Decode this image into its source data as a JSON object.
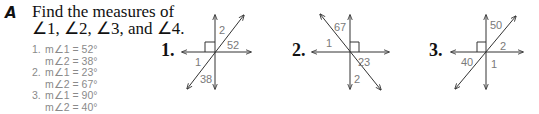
{
  "exercise": {
    "letter": "A",
    "prompt_line1": "Find the measures of",
    "prompt_line2": "∠1, ∠2, ∠3, and ∠4."
  },
  "answers": [
    {
      "num": "1.",
      "line1": "m∠1 = 52°",
      "line2": "m∠2 = 38°"
    },
    {
      "num": "2.",
      "line1": "m∠1 = 23°",
      "line2": "m∠2 = 67°"
    },
    {
      "num": "3.",
      "line1": "m∠1 = 90°",
      "line2": "m∠2 = 40°"
    }
  ],
  "problems": [
    {
      "label": "1.",
      "angle_labels": {
        "a": "2",
        "b": "52",
        "c": "1",
        "d": "38"
      }
    },
    {
      "label": "2.",
      "angle_labels": {
        "a": "67",
        "b": "1",
        "c": "23",
        "d": "2"
      }
    },
    {
      "label": "3.",
      "angle_labels": {
        "a": "50",
        "b": "2",
        "c": "40",
        "d": "1"
      }
    }
  ],
  "colors": {
    "text": "#111111",
    "answer_text": "#8a8a8a",
    "line": "#333333"
  }
}
